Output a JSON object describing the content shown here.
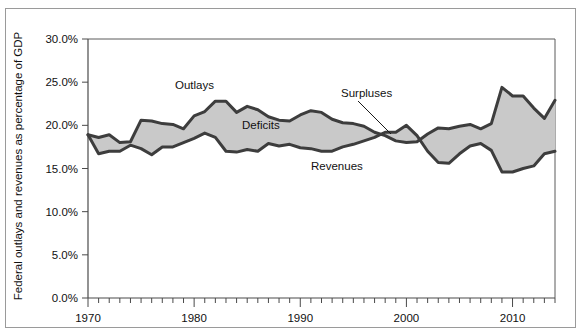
{
  "figure": {
    "y_axis_title": "Federal outlays and revenues as percentage of GDP"
  },
  "annotations": [
    {
      "name": "outlays",
      "label": "Outlays"
    },
    {
      "name": "deficits",
      "label": "Deficits"
    },
    {
      "name": "revenues",
      "label": "Revenues"
    },
    {
      "name": "surpluses",
      "label": "Surpluses"
    }
  ],
  "chart_data": {
    "type": "area",
    "title": "",
    "xlabel": "",
    "ylabel": "Federal outlays and revenues as percentage of GDP",
    "xlim": [
      1970,
      2014
    ],
    "ylim": [
      0,
      30
    ],
    "grid": false,
    "legend": "none",
    "y_tick_labels": [
      "0.0%",
      "5.0%",
      "10.0%",
      "15.0%",
      "20.0%",
      "25.0%",
      "30.0%"
    ],
    "y_tick_values": [
      0,
      5,
      10,
      15,
      20,
      25,
      30
    ],
    "x_tick_labels": [
      "1970",
      "1980",
      "1990",
      "2000",
      "2010"
    ],
    "x_tick_values": [
      1970,
      1980,
      1990,
      2000,
      2010
    ],
    "x_minor_tick_interval": 1,
    "x": [
      1970,
      1971,
      1972,
      1973,
      1974,
      1975,
      1976,
      1977,
      1978,
      1979,
      1980,
      1981,
      1982,
      1983,
      1984,
      1985,
      1986,
      1987,
      1988,
      1989,
      1990,
      1991,
      1992,
      1993,
      1994,
      1995,
      1996,
      1997,
      1998,
      1999,
      2000,
      2001,
      2002,
      2003,
      2004,
      2005,
      2006,
      2007,
      2008,
      2009,
      2010,
      2011,
      2012,
      2013,
      2014
    ],
    "series": [
      {
        "name": "Outlays",
        "color": "#3d3d3d",
        "values": [
          18.9,
          18.6,
          18.9,
          18.0,
          18.1,
          20.6,
          20.5,
          20.2,
          20.1,
          19.6,
          21.1,
          21.6,
          22.8,
          22.8,
          21.5,
          22.2,
          21.8,
          21.0,
          20.6,
          20.5,
          21.2,
          21.7,
          21.5,
          20.7,
          20.3,
          20.2,
          19.9,
          19.2,
          18.8,
          18.2,
          18.0,
          18.1,
          19.0,
          19.7,
          19.6,
          19.9,
          20.1,
          19.6,
          20.2,
          24.4,
          23.4,
          23.4,
          22.0,
          20.8,
          22.9
        ]
      },
      {
        "name": "Revenues",
        "color": "#3d3d3d",
        "values": [
          18.9,
          16.7,
          17.0,
          17.0,
          17.7,
          17.3,
          16.6,
          17.5,
          17.5,
          18.0,
          18.5,
          19.1,
          18.6,
          17.0,
          16.9,
          17.2,
          17.0,
          17.9,
          17.6,
          17.8,
          17.4,
          17.3,
          17.0,
          17.0,
          17.5,
          17.8,
          18.2,
          18.6,
          19.2,
          19.2,
          20.0,
          18.8,
          17.0,
          15.7,
          15.6,
          16.7,
          17.6,
          17.9,
          17.1,
          14.6,
          14.6,
          15.0,
          15.3,
          16.7,
          17.0
        ]
      }
    ]
  }
}
